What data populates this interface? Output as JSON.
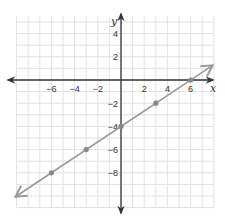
{
  "chart_data": {
    "type": "line",
    "title": "",
    "xlabel": "x",
    "ylabel": "y",
    "xlim": [
      -9,
      8
    ],
    "ylim": [
      -11,
      5.5
    ],
    "grid": true,
    "x_ticks": [
      -6,
      -4,
      -2,
      2,
      4,
      6
    ],
    "y_ticks": [
      4,
      2,
      -2,
      -4,
      -6,
      -8
    ],
    "x_tick_labels": [
      "−6",
      "−4",
      "−2",
      "2",
      "4",
      "6"
    ],
    "y_tick_labels": [
      "4",
      "2",
      "−2",
      "−4",
      "−6",
      "−8"
    ],
    "series": [
      {
        "name": "line",
        "equation": "y = (2/3)x − 4",
        "x": [
          -6,
          -3,
          0,
          3,
          6
        ],
        "y": [
          -8,
          -6,
          -4,
          -2,
          0
        ],
        "arrows_both_ends": true
      }
    ],
    "colors": {
      "grid": "#e2e2e2",
      "axis": "#333333",
      "line": "#999999",
      "points": "#888888"
    }
  }
}
